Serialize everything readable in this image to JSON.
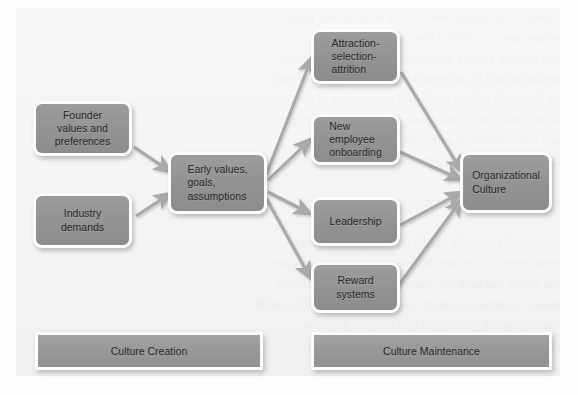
{
  "figure": {
    "background_text_lines": [
      "values to the outside world. They were the key players",
      "culture does to a firm if they had not helped the",
      "an effect on a firm's bottom line. Culture creation and",
      "organizational fit and embraced a broad organizational",
      "on the initial values, goals, and assumptions of the firm",
      "were transmitted to the newer members of the company",
      "and were reinforced and reshaped over time by the",
      "leaders who followed. Attraction-selection-attrition also",
      "",
      "organizations and also explore the factors that lead",
      "",
      "new employees to be people oriented, which in turn",
      "contributes to a culture that values customers, including",
      "the values that underpin many aspects of the operation",
      "reward systems encourage continued attention and a stable",
      "leaders require public visible action and direction",
      "culture over the long term, attraction and selection"
    ]
  },
  "nodes": [
    {
      "id": "founder",
      "label": "Founder\nvalues and\npreferences",
      "align": "ctr"
    },
    {
      "id": "industry",
      "label": "Industry\ndemands",
      "align": "ctr"
    },
    {
      "id": "early",
      "label": "Early values,\ngoals,\nassumptions",
      "align": "lft"
    },
    {
      "id": "asa",
      "label": "Attraction-\nselection-\nattrition",
      "align": "lft"
    },
    {
      "id": "onboarding",
      "label": "New\nemployee\nonboarding",
      "align": "lft"
    },
    {
      "id": "leadership",
      "label": "Leadership",
      "align": "ctr"
    },
    {
      "id": "reward",
      "label": "Reward\nsystems",
      "align": "ctr"
    },
    {
      "id": "orgculture",
      "label": "Organizational\nCulture",
      "align": "lft"
    }
  ],
  "banners": [
    {
      "id": "creation",
      "label": "Culture Creation"
    },
    {
      "id": "maintenance",
      "label": "Culture Maintenance"
    }
  ],
  "edges": [
    {
      "from": "founder",
      "to": "early"
    },
    {
      "from": "industry",
      "to": "early"
    },
    {
      "from": "early",
      "to": "asa"
    },
    {
      "from": "early",
      "to": "onboarding"
    },
    {
      "from": "early",
      "to": "leadership"
    },
    {
      "from": "early",
      "to": "reward"
    },
    {
      "from": "asa",
      "to": "orgculture"
    },
    {
      "from": "onboarding",
      "to": "orgculture"
    },
    {
      "from": "leadership",
      "to": "orgculture"
    },
    {
      "from": "reward",
      "to": "orgculture"
    }
  ],
  "colors": {
    "node_fill": "#949495",
    "node_border": "#fcfcfc",
    "arrow": "#a7a7a9",
    "panel": "#f3f3f4",
    "text": "#2b2b2b"
  }
}
